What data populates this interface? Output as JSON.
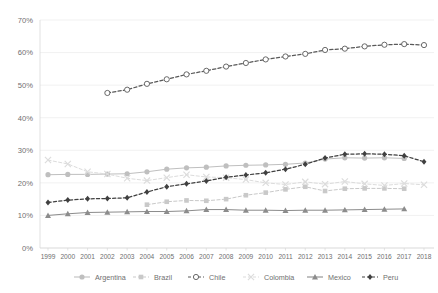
{
  "chart_data": {
    "type": "line",
    "title": "",
    "subtitle": "",
    "xlabel": "",
    "ylabel": "",
    "grid": true,
    "legend_position": "bottom",
    "ylim": [
      0,
      70
    ],
    "ytick_labels": [
      "0%",
      "10%",
      "20%",
      "30%",
      "40%",
      "50%",
      "60%",
      "70%"
    ],
    "ytick_values": [
      0,
      10,
      20,
      30,
      40,
      50,
      60,
      70
    ],
    "categories": [
      1999,
      2000,
      2001,
      2002,
      2003,
      2004,
      2005,
      2006,
      2007,
      2008,
      2009,
      2010,
      2011,
      2012,
      2013,
      2014,
      2015,
      2016,
      2017,
      2018
    ],
    "xtick_labels": [
      "1999",
      "2000",
      "2001",
      "2002",
      "2003",
      "2004",
      "2005",
      "2006",
      "2007",
      "2008",
      "2009",
      "2010",
      "2011",
      "2012",
      "2013",
      "2014",
      "2015",
      "2016",
      "2017",
      "2018"
    ],
    "series": [
      {
        "name": "Argentina",
        "color": "#bfbfbf",
        "marker": "circle",
        "dash": false,
        "values": [
          22.5,
          22.6,
          22.6,
          22.7,
          22.8,
          23.4,
          24.2,
          24.6,
          24.8,
          25.2,
          25.4,
          25.5,
          25.7,
          26.1,
          27.3,
          27.7,
          27.6,
          27.7,
          27.5,
          null
        ]
      },
      {
        "name": "Brazil",
        "color": "#c9c9c9",
        "marker": "square",
        "dash": true,
        "values": [
          null,
          null,
          null,
          null,
          null,
          13.3,
          14.2,
          14.6,
          14.5,
          15.0,
          16.2,
          17.0,
          18.0,
          18.8,
          17.5,
          18.2,
          18.3,
          18.3,
          18.2,
          null
        ]
      },
      {
        "name": "Chile",
        "color": "#595959",
        "marker": "open-circle",
        "dash": true,
        "values": [
          null,
          null,
          null,
          47.6,
          48.6,
          50.4,
          51.8,
          53.3,
          54.4,
          55.7,
          56.8,
          57.9,
          58.8,
          59.6,
          60.8,
          61.2,
          61.9,
          62.4,
          62.6,
          62.3
        ]
      },
      {
        "name": "Colombia",
        "color": "#dcdcdc",
        "marker": "x",
        "dash": true,
        "values": [
          27.0,
          25.8,
          23.4,
          22.7,
          21.4,
          20.7,
          21.6,
          22.5,
          21.8,
          21.6,
          21.0,
          20.0,
          19.5,
          20.3,
          19.6,
          20.4,
          19.7,
          19.2,
          19.8,
          19.4
        ]
      },
      {
        "name": "Mexico",
        "color": "#8c8c8c",
        "marker": "triangle",
        "dash": false,
        "values": [
          10.0,
          10.5,
          10.9,
          11.0,
          11.1,
          11.2,
          11.2,
          11.4,
          11.8,
          11.8,
          11.6,
          11.6,
          11.5,
          11.6,
          11.6,
          11.7,
          11.8,
          11.9,
          12.0,
          null
        ]
      },
      {
        "name": "Peru",
        "color": "#404040",
        "marker": "diamond",
        "dash": true,
        "values": [
          14.0,
          14.7,
          15.1,
          15.2,
          15.4,
          17.2,
          18.8,
          19.7,
          20.6,
          21.7,
          22.4,
          23.1,
          24.2,
          25.7,
          27.6,
          28.8,
          28.9,
          28.8,
          28.3,
          26.5
        ]
      }
    ]
  },
  "legend": {
    "items": [
      {
        "label": "Argentina"
      },
      {
        "label": "Brazil"
      },
      {
        "label": "Chile"
      },
      {
        "label": "Colombia"
      },
      {
        "label": "Mexico"
      },
      {
        "label": "Peru"
      }
    ]
  }
}
